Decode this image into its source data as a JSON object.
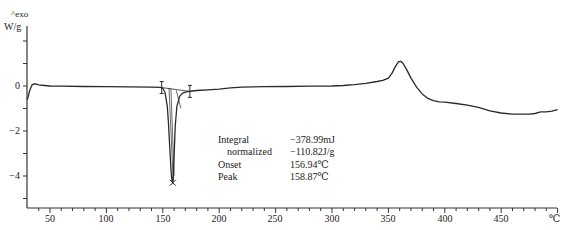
{
  "chart_data": {
    "type": "line",
    "title": "",
    "xlabel": "°C",
    "ylabel": "W/g",
    "y_direction_label": "^exo",
    "xlim": [
      30,
      500
    ],
    "ylim": [
      -5.4,
      2.4
    ],
    "grid": false,
    "x_ticks": [
      50,
      100,
      150,
      200,
      250,
      300,
      350,
      400,
      450
    ],
    "y_ticks": [
      0,
      -2,
      -4
    ],
    "series": [
      {
        "name": "DSC heat flow",
        "x": [
          30,
          32,
          34,
          36,
          38,
          40,
          45,
          50,
          60,
          80,
          100,
          120,
          140,
          148,
          150,
          152,
          154,
          155,
          156,
          156.94,
          157.5,
          158.2,
          158.87,
          159.5,
          160.2,
          161,
          162.5,
          165,
          168,
          172,
          176,
          180,
          190,
          200,
          210,
          220,
          240,
          260,
          280,
          300,
          310,
          320,
          330,
          340,
          345,
          350,
          353,
          356,
          359,
          361,
          363,
          366,
          370,
          375,
          380,
          385,
          390,
          395,
          400,
          410,
          420,
          430,
          440,
          450,
          460,
          470,
          475,
          480,
          485,
          490,
          495,
          500
        ],
        "y": [
          -0.6,
          -0.2,
          0.05,
          0.1,
          0.08,
          0.05,
          0.02,
          0.0,
          -0.01,
          -0.02,
          -0.03,
          -0.04,
          -0.05,
          -0.06,
          -0.1,
          -0.3,
          -0.9,
          -1.6,
          -2.6,
          -3.4,
          -3.9,
          -4.2,
          -4.3,
          -3.9,
          -2.9,
          -1.8,
          -0.9,
          -0.45,
          -0.3,
          -0.25,
          -0.22,
          -0.2,
          -0.17,
          -0.14,
          -0.08,
          -0.05,
          -0.03,
          -0.02,
          -0.01,
          0.0,
          0.02,
          0.06,
          0.12,
          0.2,
          0.25,
          0.35,
          0.55,
          0.85,
          1.08,
          1.1,
          1.0,
          0.75,
          0.35,
          -0.05,
          -0.35,
          -0.55,
          -0.65,
          -0.7,
          -0.72,
          -0.78,
          -0.85,
          -0.95,
          -1.1,
          -1.2,
          -1.25,
          -1.25,
          -1.25,
          -1.22,
          -1.15,
          -1.15,
          -1.12,
          -1.05
        ]
      }
    ],
    "annotations": {
      "integral": "-378.99mJ",
      "normalized": "-110.82J/g",
      "onset": "156.94°C",
      "peak": "158.87°C",
      "integration_limits_x": [
        149,
        174
      ]
    }
  },
  "axis": {
    "y_unit": "W/g",
    "exo_label": "^exo",
    "x_unit": "℃",
    "y_tick_labels": [
      "0",
      "−2",
      "−4"
    ],
    "x_tick_labels": [
      "50",
      "100",
      "150",
      "200",
      "250",
      "300",
      "350",
      "400",
      "450"
    ]
  },
  "annotation_box": {
    "rows": [
      {
        "key": "Integral",
        "value": "−378.99mJ"
      },
      {
        "key": "normalized",
        "value": "−110.82J/g"
      },
      {
        "key": "Onset",
        "value": "156.94℃"
      },
      {
        "key": "Peak",
        "value": "158.87℃"
      }
    ]
  },
  "colors": {
    "line": "#2a2a2a",
    "axis": "#333333",
    "background": "#ffffff"
  }
}
